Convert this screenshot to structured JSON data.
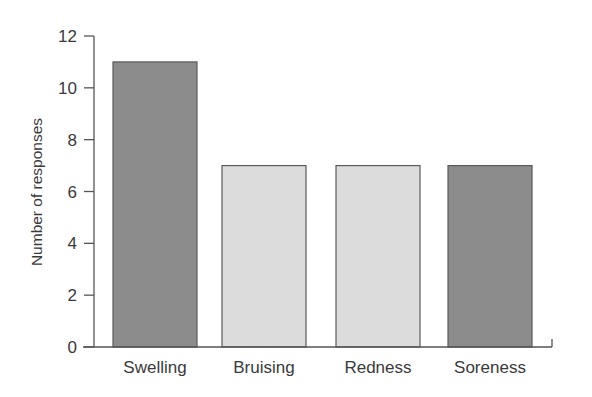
{
  "chart_data": {
    "type": "bar",
    "title": "",
    "xlabel": "",
    "ylabel": "Number of responses",
    "categories": [
      "Swelling",
      "Bruising",
      "Redness",
      "Soreness"
    ],
    "values": [
      11,
      7,
      7,
      7
    ],
    "bar_colors": [
      "#8c8c8c",
      "#dcdcdc",
      "#dcdcdc",
      "#8c8c8c"
    ],
    "ylim": [
      0,
      12
    ],
    "yticks": [
      0,
      2,
      4,
      6,
      8,
      10,
      12
    ],
    "grid": false,
    "legend": null
  },
  "colors": {
    "axis": "#555555",
    "bar_edge": "#5a5a5a",
    "text": "#3a3a3a"
  }
}
